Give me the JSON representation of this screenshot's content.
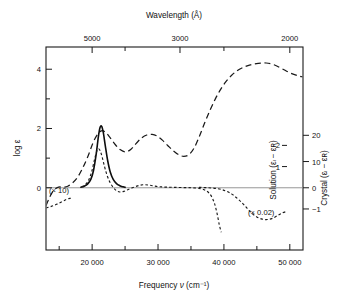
{
  "figure": {
    "background": "#ffffff",
    "ink": "#1a1a1a"
  },
  "top_axis": {
    "title": "Wavelength (Å)",
    "tick_labels": [
      "5000",
      "3000",
      "2000"
    ],
    "tick_values": [
      5000,
      3000,
      2000
    ],
    "minor_tick_values": [
      4000,
      2500
    ]
  },
  "bottom_axis": {
    "title_prefix": "Frequency ",
    "title_symbol": "ν",
    "title_units": " (cm⁻¹)",
    "title_full": "Frequency ν (cm⁻¹)",
    "tick_labels": [
      "20 000",
      "30 000",
      "40 000",
      "50 000"
    ],
    "tick_values": [
      20000,
      30000,
      40000,
      50000
    ],
    "range": [
      13000,
      52000
    ]
  },
  "left_axis": {
    "title": "log ε",
    "tick_labels": [
      "0",
      "2",
      "4"
    ],
    "tick_values": [
      0,
      2,
      4
    ],
    "range": [
      -2.1,
      4.75
    ]
  },
  "right_axis_inner": {
    "title": "Solution (εₗ − εʀ)",
    "tick_labels": [
      "1",
      "2"
    ],
    "tick_values": [
      1,
      2
    ]
  },
  "right_axis_outer": {
    "title": "Crystal (εₗ − εʀ)",
    "tick_labels": [
      "−1",
      "0",
      "10",
      "20"
    ],
    "tick_values": [
      -1,
      0,
      10,
      20
    ]
  },
  "annotations": [
    {
      "name": "scale-times-ten",
      "text": "(× 10)"
    },
    {
      "name": "scale-times-point-zero-two",
      "text": "(× 0.02)"
    }
  ],
  "chart_data": {
    "type": "line",
    "title": "",
    "xlabel": "Frequency ν (cm⁻¹)",
    "ylabel": "log ε",
    "xlim": [
      13000,
      52000
    ],
    "ylim": [
      -2.1,
      4.75
    ],
    "grid": false,
    "legend": "none",
    "secondary_axes": [
      {
        "name": "Solution (εL − εR)",
        "ticks": [
          0,
          1,
          2
        ]
      },
      {
        "name": "Crystal (εL − εR)",
        "ticks": [
          -1,
          0,
          10,
          20
        ]
      }
    ],
    "top_axis": {
      "name": "Wavelength (Å)",
      "ticks": [
        5000,
        4000,
        3000,
        2500,
        2000
      ]
    },
    "series": [
      {
        "name": "absorption-log-epsilon",
        "style": "long-dashed",
        "axis": "left",
        "points": [
          [
            13000,
            -0.6
          ],
          [
            13600,
            -0.3
          ],
          [
            14200,
            -0.08
          ],
          [
            14900,
            0.02
          ],
          [
            15600,
            0.02
          ],
          [
            16300,
            0.05
          ],
          [
            17000,
            0.16
          ],
          [
            17800,
            0.36
          ],
          [
            18600,
            0.68
          ],
          [
            19400,
            1.08
          ],
          [
            20100,
            1.5
          ],
          [
            20800,
            1.8
          ],
          [
            21400,
            1.92
          ],
          [
            22000,
            1.88
          ],
          [
            22700,
            1.7
          ],
          [
            23500,
            1.46
          ],
          [
            24300,
            1.28
          ],
          [
            25100,
            1.21
          ],
          [
            25900,
            1.3
          ],
          [
            26700,
            1.5
          ],
          [
            27500,
            1.68
          ],
          [
            28300,
            1.78
          ],
          [
            29100,
            1.8
          ],
          [
            29900,
            1.74
          ],
          [
            30700,
            1.6
          ],
          [
            31500,
            1.42
          ],
          [
            32300,
            1.25
          ],
          [
            33100,
            1.12
          ],
          [
            33900,
            1.06
          ],
          [
            34700,
            1.12
          ],
          [
            35500,
            1.35
          ],
          [
            36300,
            1.75
          ],
          [
            37100,
            2.2
          ],
          [
            37900,
            2.62
          ],
          [
            38700,
            3.0
          ],
          [
            39500,
            3.32
          ],
          [
            40300,
            3.58
          ],
          [
            41100,
            3.78
          ],
          [
            42000,
            3.95
          ],
          [
            43000,
            4.07
          ],
          [
            44000,
            4.15
          ],
          [
            45200,
            4.2
          ],
          [
            46400,
            4.21
          ],
          [
            47600,
            4.15
          ],
          [
            48800,
            4.02
          ],
          [
            50000,
            3.88
          ],
          [
            51200,
            3.78
          ],
          [
            52000,
            3.74
          ]
        ]
      },
      {
        "name": "crystal-cd-solid",
        "style": "solid",
        "axis": "crystal",
        "points": [
          [
            18300,
            0.2
          ],
          [
            18800,
            0.6
          ],
          [
            19300,
            1.4
          ],
          [
            19800,
            3.2
          ],
          [
            20200,
            6.5
          ],
          [
            20600,
            12.5
          ],
          [
            20950,
            19.5
          ],
          [
            21200,
            23.0
          ],
          [
            21450,
            23.4
          ],
          [
            21700,
            21.0
          ],
          [
            22000,
            16.0
          ],
          [
            22350,
            10.5
          ],
          [
            22750,
            6.0
          ],
          [
            23200,
            3.2
          ],
          [
            23700,
            1.6
          ],
          [
            24200,
            0.8
          ],
          [
            24700,
            0.35
          ],
          [
            25000,
            0.15
          ]
        ]
      },
      {
        "name": "solution-cd-dotted-low-frequency",
        "style": "dotted",
        "axis": "solution",
        "points": [
          [
            13000,
            -0.95
          ],
          [
            13800,
            -0.88
          ],
          [
            14600,
            -0.78
          ],
          [
            15400,
            -0.66
          ],
          [
            16100,
            -0.55
          ],
          [
            16600,
            -0.5
          ],
          [
            17000,
            -0.5
          ]
        ]
      },
      {
        "name": "solution-cd-dotted-main",
        "style": "dotted",
        "axis": "solution",
        "points": [
          [
            18400,
            0.04
          ],
          [
            19000,
            0.16
          ],
          [
            19500,
            0.38
          ],
          [
            19950,
            0.78
          ],
          [
            20350,
            1.32
          ],
          [
            20700,
            1.72
          ],
          [
            20950,
            1.84
          ],
          [
            21200,
            1.76
          ],
          [
            21500,
            1.48
          ],
          [
            21850,
            1.04
          ],
          [
            22250,
            0.6
          ],
          [
            22700,
            0.26
          ],
          [
            23200,
            0.02
          ],
          [
            23700,
            -0.14
          ],
          [
            24200,
            -0.2
          ],
          [
            24800,
            -0.17
          ],
          [
            25400,
            -0.09
          ],
          [
            26100,
            0.0
          ],
          [
            26900,
            0.09
          ],
          [
            27700,
            0.14
          ],
          [
            28500,
            0.13
          ],
          [
            29300,
            0.09
          ],
          [
            30200,
            0.05
          ],
          [
            31200,
            0.03
          ],
          [
            32400,
            0.02
          ],
          [
            33800,
            0.01
          ],
          [
            35200,
            0.0
          ],
          [
            36400,
            -0.04
          ],
          [
            37300,
            -0.14
          ],
          [
            38000,
            -0.35
          ],
          [
            38550,
            -0.72
          ],
          [
            38950,
            -1.2
          ],
          [
            39300,
            -1.75
          ],
          [
            39600,
            -2.1
          ]
        ]
      },
      {
        "name": "crystal-cd-dotted-uv",
        "style": "dotted",
        "axis": "crystal-uv",
        "points": [
          [
            36200,
            0.02
          ],
          [
            37600,
            0.0
          ],
          [
            39000,
            -0.04
          ],
          [
            40200,
            -0.14
          ],
          [
            41200,
            -0.3
          ],
          [
            42100,
            -0.52
          ],
          [
            42900,
            -0.76
          ],
          [
            43600,
            -1.0
          ],
          [
            44300,
            -1.22
          ],
          [
            45000,
            -1.38
          ],
          [
            45800,
            -1.48
          ],
          [
            46600,
            -1.5
          ],
          [
            47400,
            -1.44
          ],
          [
            48200,
            -1.3
          ],
          [
            48900,
            -1.18
          ],
          [
            49500,
            -1.12
          ]
        ]
      }
    ]
  }
}
